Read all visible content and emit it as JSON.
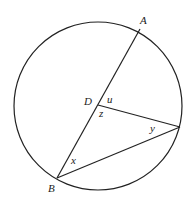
{
  "diagram": {
    "type": "circle-geometry",
    "circle": {
      "cx": 98,
      "cy": 106,
      "r": 84
    },
    "points": {
      "A": {
        "x": 140,
        "y": 29,
        "label": "A"
      },
      "D": {
        "x": 98,
        "y": 105,
        "label": "D"
      },
      "B": {
        "x": 57,
        "y": 178,
        "label": "B"
      },
      "C": {
        "x": 180,
        "y": 127,
        "label": ""
      }
    },
    "angles": {
      "u": "u",
      "z": "z",
      "y": "y",
      "x": "x"
    },
    "colors": {
      "stroke": "#222222",
      "background": "#ffffff"
    }
  }
}
